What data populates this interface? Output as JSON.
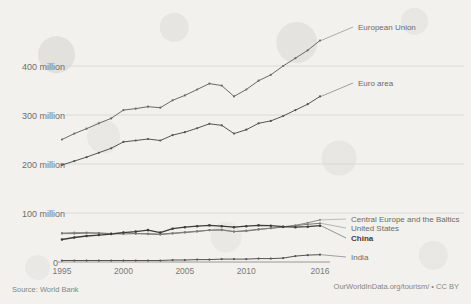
{
  "source_note": "Source: World Bank",
  "credit": "OurWorldInData.org/tourism/ • CC BY",
  "axes": {
    "y_ticks": [
      {
        "label": "400 million",
        "value": 400
      },
      {
        "label": "300 million",
        "value": 300
      },
      {
        "label": "200 million",
        "value": 200
      },
      {
        "label": "100 million",
        "value": 100
      }
    ],
    "zero_label": "0",
    "x_ticks": [
      {
        "label": "1995",
        "value": 1995
      },
      {
        "label": "2000",
        "value": 2000
      },
      {
        "label": "2005",
        "value": 2005
      },
      {
        "label": "2010",
        "value": 2010
      },
      {
        "label": "2016",
        "value": 2016
      }
    ]
  },
  "chart_data": {
    "type": "line",
    "title": "",
    "xlabel": "",
    "ylabel": "",
    "xlim": [
      1995,
      2016
    ],
    "ylim": [
      0,
      460
    ],
    "grid": true,
    "legend": "right-inline",
    "x": [
      1995,
      1996,
      1997,
      1998,
      1999,
      2000,
      2001,
      2002,
      2003,
      2004,
      2005,
      2006,
      2007,
      2008,
      2009,
      2010,
      2011,
      2012,
      2013,
      2014,
      2015,
      2016
    ],
    "series": [
      {
        "name": "European Union",
        "label": "European Union",
        "color": "#6b6b65",
        "bold": false,
        "values": [
          250,
          262,
          272,
          283,
          293,
          310,
          313,
          317,
          315,
          330,
          340,
          352,
          364,
          360,
          338,
          352,
          370,
          382,
          400,
          416,
          432,
          452
        ]
      },
      {
        "name": "Euro area",
        "label": "Euro area",
        "color": "#55554f",
        "bold": false,
        "values": [
          198,
          206,
          214,
          223,
          232,
          245,
          248,
          251,
          248,
          259,
          265,
          273,
          282,
          279,
          262,
          270,
          283,
          288,
          298,
          310,
          322,
          338
        ]
      },
      {
        "name": "Central Europe and the Baltics",
        "label": "Central Europe and the Baltics",
        "color": "#8a8a83",
        "bold": false,
        "values": [
          59,
          60,
          60,
          59,
          58,
          57,
          58,
          58,
          57,
          59,
          61,
          63,
          65,
          65,
          62,
          63,
          66,
          69,
          72,
          75,
          80,
          86
        ]
      },
      {
        "name": "United States",
        "label": "United States",
        "color": "#7b7b74",
        "bold": false,
        "values": [
          58,
          58,
          59,
          59,
          58,
          60,
          58,
          57,
          56,
          58,
          60,
          62,
          65,
          66,
          62,
          64,
          67,
          69,
          71,
          74,
          77,
          79
        ]
      },
      {
        "name": "China",
        "label": "China",
        "color": "#3d3d39",
        "bold": true,
        "values": [
          46,
          50,
          53,
          55,
          57,
          60,
          62,
          65,
          60,
          68,
          71,
          73,
          75,
          73,
          71,
          73,
          75,
          74,
          72,
          71,
          72,
          74
        ]
      },
      {
        "name": "India",
        "label": "India",
        "color": "#55554f",
        "bold": false,
        "values": [
          3,
          3,
          3,
          3,
          3,
          3,
          3,
          3,
          3,
          4,
          4,
          5,
          5,
          6,
          6,
          6,
          7,
          7,
          8,
          12,
          14,
          15
        ]
      }
    ]
  }
}
